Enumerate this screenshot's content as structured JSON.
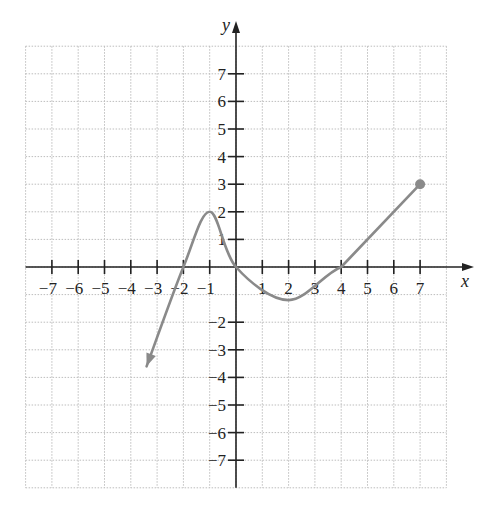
{
  "chart_data": {
    "type": "line",
    "title": "",
    "xlabel": "x",
    "ylabel": "y",
    "xlim": [
      -8,
      8
    ],
    "ylim": [
      -8,
      8
    ],
    "grid": true,
    "grid_style": "dotted",
    "x_ticks": [
      -7,
      -6,
      -5,
      -4,
      -3,
      -2,
      -1,
      1,
      2,
      3,
      4,
      5,
      6,
      7
    ],
    "y_ticks": [
      -7,
      -6,
      -5,
      -4,
      -3,
      -2,
      1,
      2,
      3,
      4,
      5,
      6,
      7
    ],
    "x_tick_labels": [
      "−7",
      "−6",
      "−5",
      "−4",
      "−3",
      "−2",
      "−1",
      "1",
      "2",
      "3",
      "4",
      "5",
      "6",
      "7"
    ],
    "y_tick_labels": [
      "−7",
      "−6",
      "−5",
      "−4",
      "−3",
      "−2",
      "1",
      "2",
      "3",
      "4",
      "5",
      "6",
      "7"
    ],
    "series": [
      {
        "name": "f(x)",
        "color": "#8a8a8a",
        "start": {
          "type": "arrow",
          "point": [
            -3.4,
            -3.6
          ]
        },
        "end": {
          "type": "closed-dot",
          "point": [
            7,
            3
          ]
        },
        "key_points": [
          {
            "x": -3.4,
            "y": -3.6,
            "note": "arrow (continues)"
          },
          {
            "x": -2,
            "y": 0,
            "note": "x-intercept"
          },
          {
            "x": -1,
            "y": 2,
            "note": "local maximum"
          },
          {
            "x": 0,
            "y": 0,
            "note": "origin / intercept"
          },
          {
            "x": 2,
            "y": -1.2,
            "note": "local minimum"
          },
          {
            "x": 4,
            "y": 0,
            "note": "x-intercept"
          },
          {
            "x": 7,
            "y": 3,
            "note": "closed endpoint"
          }
        ]
      }
    ]
  },
  "colors": {
    "axis": "#222222",
    "grid": "#bdbdbd",
    "curve": "#8a8a8a",
    "background": "#ffffff"
  }
}
